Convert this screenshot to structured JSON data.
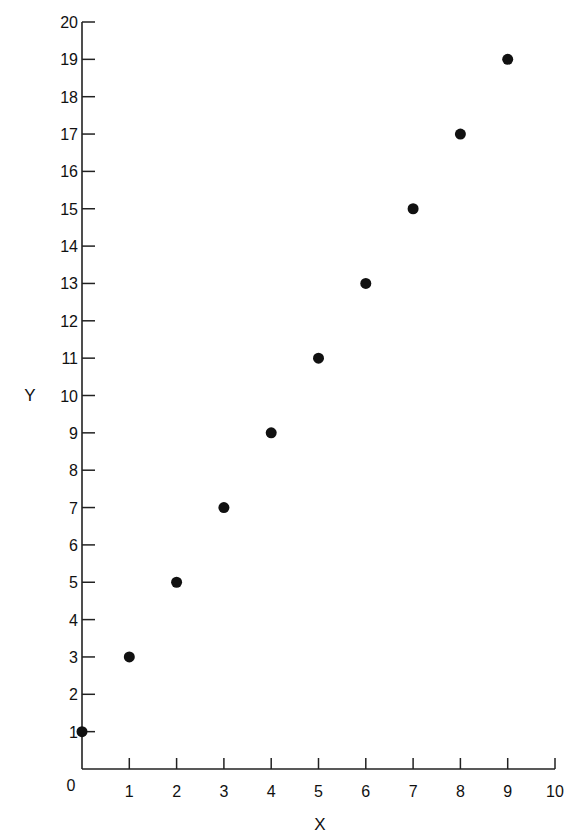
{
  "chart_data": {
    "type": "scatter",
    "title": "",
    "xlabel": "X",
    "ylabel": "Y",
    "xlim": [
      0,
      10
    ],
    "ylim": [
      0,
      20
    ],
    "x_ticks": [
      0,
      1,
      2,
      3,
      4,
      5,
      6,
      7,
      8,
      9,
      10
    ],
    "y_ticks": [
      1,
      2,
      3,
      4,
      5,
      6,
      7,
      8,
      9,
      10,
      11,
      12,
      13,
      14,
      15,
      16,
      17,
      18,
      19,
      20
    ],
    "origin_label": "0",
    "grid": false,
    "legend": null,
    "series": [
      {
        "name": "data",
        "marker": "filled-circle",
        "color": "#111111",
        "points": [
          {
            "x": 0,
            "y": 1
          },
          {
            "x": 1,
            "y": 3
          },
          {
            "x": 2,
            "y": 5
          },
          {
            "x": 3,
            "y": 7
          },
          {
            "x": 4,
            "y": 9
          },
          {
            "x": 5,
            "y": 11
          },
          {
            "x": 6,
            "y": 13
          },
          {
            "x": 7,
            "y": 15
          },
          {
            "x": 8,
            "y": 17
          },
          {
            "x": 9,
            "y": 19
          }
        ]
      }
    ]
  },
  "layout": {
    "plot_left": 82,
    "plot_bottom": 769,
    "x_unit_px": 47.3,
    "y_unit_px": 37.35,
    "axis_color": "#222222",
    "marker_radius": 5.5
  }
}
